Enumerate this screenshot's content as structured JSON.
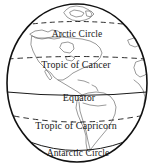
{
  "figure": {
    "projection": "orthographic",
    "centered_on": "the Americas",
    "background_color": "#ffffff",
    "line_color": "#1a1a1a",
    "coastline_color": "#6b6b6b"
  },
  "globe": {
    "outline_name": "globe-outline",
    "center_x": 77,
    "center_y": 83,
    "radius_x": 70,
    "radius_y": 79
  },
  "latitude_lines": [
    {
      "id": "arctic-circle",
      "label": "Arctic Circle",
      "style": "dashed",
      "y": 26,
      "curve_dip": -9
    },
    {
      "id": "tropic-of-cancer",
      "label": "Tropic of Cancer",
      "style": "dashed",
      "y": 59,
      "curve_dip": -5
    },
    {
      "id": "equator",
      "label": "Equator",
      "style": "solid",
      "y": 95,
      "curve_dip": 4
    },
    {
      "id": "tropic-of-capricorn",
      "label": "Tropic of Capricorn",
      "style": "dashed",
      "y": 123,
      "curve_dip": 8
    },
    {
      "id": "antarctic-circle",
      "label": "Antarctic Circle",
      "style": "solid",
      "y": 150,
      "curve_dip": 11
    }
  ],
  "continents": [
    {
      "id": "north-america",
      "label": "North America"
    },
    {
      "id": "south-america",
      "label": "South America"
    },
    {
      "id": "greenland",
      "label": "Greenland"
    },
    {
      "id": "west-africa",
      "label": "West Africa"
    }
  ]
}
